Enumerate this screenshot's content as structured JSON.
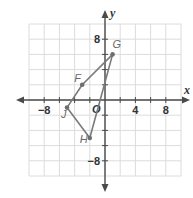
{
  "chart_data": {
    "type": "scatter",
    "title": "",
    "xlabel": "x",
    "ylabel": "y",
    "origin_label": "O",
    "xlim": [
      -10,
      10
    ],
    "ylim": [
      -10,
      10
    ],
    "grid": true,
    "grid_step": 2,
    "x_tick_labels": [
      {
        "value": -8,
        "label": "−8"
      },
      {
        "value": 4,
        "label": "4"
      },
      {
        "value": 8,
        "label": "8"
      }
    ],
    "y_tick_labels": [
      {
        "value": 8,
        "label": "8"
      },
      {
        "value": -8,
        "label": "−8"
      }
    ],
    "points": [
      {
        "name": "F",
        "x": -3,
        "y": 2
      },
      {
        "name": "G",
        "x": 1,
        "y": 6
      },
      {
        "name": "H",
        "x": -2,
        "y": -5
      },
      {
        "name": "J",
        "x": -5,
        "y": -1
      }
    ],
    "polygon_order": [
      "F",
      "G",
      "H",
      "J"
    ],
    "colors": {
      "grid": "#dcdcdc",
      "axis": "#4a4a4a",
      "polygon": "#7a7a7a",
      "point": "#6e6e6e"
    }
  }
}
